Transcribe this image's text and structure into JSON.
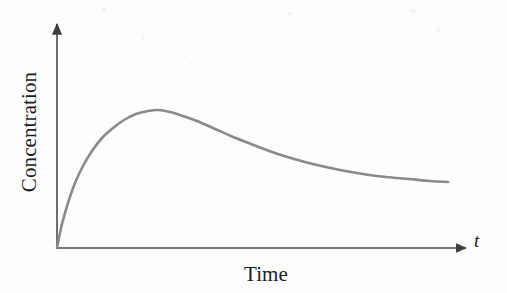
{
  "figure": {
    "name": "concentration-time-curve",
    "background_color": "#fdfdfd",
    "axis_color": "#4a4a4a",
    "curve_color": "#8a8a8a",
    "text_color": "#1c1c1c"
  },
  "labels": {
    "y_axis": "Concentration",
    "x_axis": "Time",
    "x_axis_variable": "t"
  },
  "chart_data": {
    "type": "line",
    "title": "",
    "xlabel": "Time",
    "ylabel": "Concentration",
    "x_variable": "t",
    "grid": false,
    "legend": false,
    "axes": {
      "x_arrow": true,
      "y_arrow": true,
      "x_ticks": [],
      "y_ticks": [],
      "origin_px": [
        57,
        248
      ],
      "x_end_px": [
        470,
        248
      ],
      "y_end_px": [
        57,
        20
      ]
    },
    "xlim": [
      0,
      1
    ],
    "ylim": [
      0,
      1
    ],
    "series": [
      {
        "name": "Concentration",
        "color": "#8a8a8a",
        "points_px": [
          [
            57,
            248
          ],
          [
            62,
            224
          ],
          [
            68,
            203
          ],
          [
            75,
            183
          ],
          [
            83,
            166
          ],
          [
            92,
            151
          ],
          [
            102,
            138
          ],
          [
            113,
            128
          ],
          [
            124,
            120
          ],
          [
            136,
            114
          ],
          [
            148,
            111
          ],
          [
            158,
            110
          ],
          [
            170,
            112
          ],
          [
            183,
            116
          ],
          [
            197,
            121
          ],
          [
            213,
            128
          ],
          [
            231,
            136
          ],
          [
            251,
            144
          ],
          [
            272,
            152
          ],
          [
            294,
            159
          ],
          [
            317,
            165
          ],
          [
            340,
            170
          ],
          [
            363,
            174
          ],
          [
            386,
            177
          ],
          [
            409,
            179
          ],
          [
            430,
            181
          ],
          [
            448,
            182
          ]
        ],
        "x": [
          0.0,
          0.01,
          0.03,
          0.04,
          0.06,
          0.08,
          0.11,
          0.14,
          0.16,
          0.19,
          0.22,
          0.24,
          0.27,
          0.31,
          0.34,
          0.38,
          0.42,
          0.47,
          0.52,
          0.57,
          0.63,
          0.69,
          0.74,
          0.8,
          0.85,
          0.9,
          0.95
        ],
        "y": [
          0.0,
          0.11,
          0.2,
          0.28,
          0.36,
          0.43,
          0.48,
          0.53,
          0.56,
          0.59,
          0.6,
          0.61,
          0.6,
          0.58,
          0.56,
          0.53,
          0.49,
          0.46,
          0.42,
          0.39,
          0.36,
          0.34,
          0.32,
          0.31,
          0.3,
          0.29,
          0.29
        ]
      }
    ],
    "annotations": {
      "peak_px": [
        152,
        110
      ],
      "peak_description": "maximum concentration",
      "end_px": [
        448,
        182
      ]
    }
  }
}
